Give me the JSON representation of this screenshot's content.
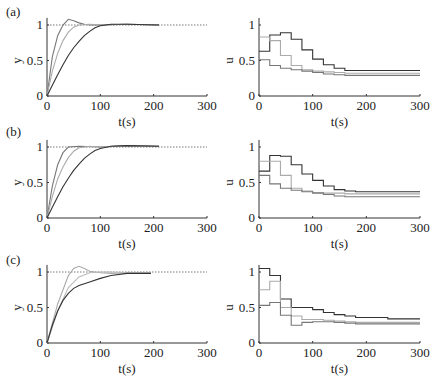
{
  "figure": {
    "panels": [
      {
        "label": "(a)"
      },
      {
        "label": "(b)"
      },
      {
        "label": "(c)"
      }
    ]
  },
  "chart_data": [
    {
      "panel": "(a)",
      "side": "left",
      "type": "line",
      "title": "",
      "xlabel": "t(s)",
      "ylabel": "y",
      "xlim": [
        0,
        300
      ],
      "ylim": [
        0,
        1.1
      ],
      "xticks": [
        "0",
        "100",
        "200",
        "300"
      ],
      "yticks": [
        "0",
        "0.5",
        "1"
      ],
      "reference": {
        "name": "setpoint",
        "y": 1,
        "style": "dotted"
      },
      "series": [
        {
          "name": "fast",
          "color": "#777777",
          "x": [
            0,
            10,
            20,
            30,
            40,
            50,
            60,
            70,
            80,
            100,
            150,
            210
          ],
          "y": [
            0,
            0.55,
            0.85,
            1.0,
            1.08,
            1.06,
            1.03,
            1.01,
            1.0,
            1.0,
            1.01,
            1.0
          ]
        },
        {
          "name": "medium",
          "color": "#aaaaaa",
          "x": [
            0,
            10,
            20,
            30,
            40,
            50,
            60,
            80,
            100,
            150,
            210
          ],
          "y": [
            0,
            0.35,
            0.6,
            0.78,
            0.9,
            0.97,
            1.0,
            1.01,
            1.0,
            1.01,
            1.0
          ]
        },
        {
          "name": "slow",
          "color": "#333333",
          "x": [
            0,
            10,
            20,
            30,
            40,
            50,
            60,
            70,
            80,
            90,
            100,
            120,
            150,
            210
          ],
          "y": [
            0,
            0.15,
            0.3,
            0.44,
            0.57,
            0.68,
            0.77,
            0.85,
            0.91,
            0.96,
            0.99,
            1.01,
            1.01,
            1.0
          ]
        }
      ]
    },
    {
      "panel": "(a)",
      "side": "right",
      "type": "line",
      "step": true,
      "title": "",
      "xlabel": "t(s)",
      "ylabel": "u",
      "xlim": [
        0,
        300
      ],
      "ylim": [
        0,
        1.1
      ],
      "xticks": [
        "0",
        "100",
        "200",
        "300"
      ],
      "yticks": [
        "0",
        "0.5",
        "1"
      ],
      "series": [
        {
          "name": "slow",
          "color": "#333333",
          "x": [
            0,
            20,
            40,
            60,
            80,
            100,
            120,
            140,
            160,
            300
          ],
          "y": [
            0.63,
            0.86,
            0.89,
            0.8,
            0.65,
            0.52,
            0.44,
            0.39,
            0.36,
            0.36
          ]
        },
        {
          "name": "medium",
          "color": "#aaaaaa",
          "x": [
            0,
            20,
            40,
            60,
            80,
            100,
            120,
            140,
            160,
            300
          ],
          "y": [
            0.83,
            0.78,
            0.57,
            0.43,
            0.37,
            0.35,
            0.34,
            0.33,
            0.32,
            0.32
          ]
        },
        {
          "name": "fast",
          "color": "#777777",
          "x": [
            0,
            20,
            40,
            60,
            80,
            100,
            120,
            140,
            160,
            300
          ],
          "y": [
            0.51,
            0.43,
            0.39,
            0.37,
            0.35,
            0.33,
            0.31,
            0.3,
            0.29,
            0.29
          ]
        }
      ]
    },
    {
      "panel": "(b)",
      "side": "left",
      "type": "line",
      "title": "",
      "xlabel": "t(s)",
      "ylabel": "y",
      "xlim": [
        0,
        300
      ],
      "ylim": [
        0,
        1.1
      ],
      "xticks": [
        "0",
        "100",
        "200",
        "300"
      ],
      "yticks": [
        "0",
        "0.5",
        "1"
      ],
      "reference": {
        "name": "setpoint",
        "y": 1,
        "style": "dotted"
      },
      "series": [
        {
          "name": "fast",
          "color": "#777777",
          "x": [
            0,
            10,
            20,
            30,
            40,
            60,
            100,
            150,
            210
          ],
          "y": [
            0,
            0.45,
            0.75,
            0.92,
            1.0,
            1.01,
            1.0,
            1.02,
            1.01
          ]
        },
        {
          "name": "medium",
          "color": "#aaaaaa",
          "x": [
            0,
            10,
            20,
            30,
            40,
            50,
            60,
            80,
            100,
            150,
            210
          ],
          "y": [
            0,
            0.3,
            0.55,
            0.72,
            0.85,
            0.94,
            0.99,
            1.01,
            1.0,
            1.02,
            1.01
          ]
        },
        {
          "name": "slow",
          "color": "#333333",
          "x": [
            0,
            10,
            20,
            30,
            40,
            50,
            60,
            70,
            80,
            90,
            100,
            120,
            150,
            210
          ],
          "y": [
            0,
            0.15,
            0.3,
            0.44,
            0.56,
            0.67,
            0.76,
            0.84,
            0.9,
            0.95,
            0.98,
            1.01,
            1.02,
            1.01
          ]
        }
      ]
    },
    {
      "panel": "(b)",
      "side": "right",
      "type": "line",
      "step": true,
      "title": "",
      "xlabel": "t(s)",
      "ylabel": "u",
      "xlim": [
        0,
        300
      ],
      "ylim": [
        0,
        1.1
      ],
      "xticks": [
        "0",
        "100",
        "200",
        "300"
      ],
      "yticks": [
        "0",
        "0.5",
        "1"
      ],
      "series": [
        {
          "name": "slow",
          "color": "#333333",
          "x": [
            0,
            20,
            40,
            60,
            80,
            100,
            120,
            140,
            160,
            180,
            300
          ],
          "y": [
            0.66,
            0.88,
            0.87,
            0.75,
            0.62,
            0.53,
            0.45,
            0.4,
            0.38,
            0.37,
            0.37
          ]
        },
        {
          "name": "medium",
          "color": "#aaaaaa",
          "x": [
            0,
            20,
            40,
            60,
            80,
            100,
            120,
            140,
            160,
            180,
            300
          ],
          "y": [
            0.8,
            0.8,
            0.6,
            0.42,
            0.38,
            0.36,
            0.35,
            0.35,
            0.34,
            0.34,
            0.34
          ]
        },
        {
          "name": "fast",
          "color": "#777777",
          "x": [
            0,
            20,
            40,
            60,
            80,
            100,
            120,
            140,
            160,
            180,
            300
          ],
          "y": [
            0.6,
            0.48,
            0.42,
            0.39,
            0.37,
            0.35,
            0.33,
            0.31,
            0.3,
            0.3,
            0.3
          ]
        }
      ]
    },
    {
      "panel": "(c)",
      "side": "left",
      "type": "line",
      "title": "",
      "xlabel": "t(s)",
      "ylabel": "y",
      "xlim": [
        0,
        300
      ],
      "ylim": [
        0,
        1.1
      ],
      "xticks": [
        "0",
        "100",
        "200",
        "300"
      ],
      "yticks": [
        "0",
        "0.5",
        "1"
      ],
      "reference": {
        "name": "setpoint",
        "y": 1,
        "style": "dotted"
      },
      "series": [
        {
          "name": "fast",
          "color": "#aaaaaa",
          "x": [
            0,
            20,
            40,
            50,
            60,
            70,
            80,
            100,
            120,
            150,
            195
          ],
          "y": [
            0,
            0.55,
            0.95,
            1.05,
            1.08,
            1.05,
            1.01,
            0.99,
            0.98,
            0.99,
            0.99
          ]
        },
        {
          "name": "medium",
          "color": "#bbbbbb",
          "x": [
            0,
            20,
            40,
            60,
            80,
            100,
            120,
            150,
            195
          ],
          "y": [
            0,
            0.45,
            0.78,
            0.93,
            0.99,
            1.0,
            1.0,
            0.99,
            0.99
          ]
        },
        {
          "name": "slow",
          "color": "#333333",
          "x": [
            0,
            10,
            20,
            30,
            40,
            50,
            60,
            80,
            100,
            120,
            150,
            195
          ],
          "y": [
            0,
            0.25,
            0.45,
            0.6,
            0.7,
            0.77,
            0.81,
            0.86,
            0.91,
            0.95,
            0.98,
            0.98
          ]
        }
      ]
    },
    {
      "panel": "(c)",
      "side": "right",
      "type": "line",
      "step": true,
      "title": "",
      "xlabel": "t(s)",
      "ylabel": "u",
      "xlim": [
        0,
        300
      ],
      "ylim": [
        0,
        1.1
      ],
      "xticks": [
        "0",
        "100",
        "200",
        "300"
      ],
      "yticks": [
        "0",
        "0.5",
        "1"
      ],
      "series": [
        {
          "name": "slow",
          "color": "#333333",
          "x": [
            0,
            20,
            40,
            60,
            80,
            100,
            120,
            140,
            160,
            180,
            200,
            240,
            300
          ],
          "y": [
            1.05,
            0.95,
            0.62,
            0.5,
            0.5,
            0.47,
            0.43,
            0.4,
            0.38,
            0.36,
            0.36,
            0.34,
            0.34
          ]
        },
        {
          "name": "medium",
          "color": "#aaaaaa",
          "x": [
            0,
            20,
            40,
            60,
            80,
            100,
            120,
            140,
            160,
            180,
            300
          ],
          "y": [
            0.75,
            0.87,
            0.5,
            0.38,
            0.33,
            0.33,
            0.32,
            0.31,
            0.3,
            0.29,
            0.29
          ]
        },
        {
          "name": "fast",
          "color": "#777777",
          "x": [
            0,
            20,
            40,
            60,
            80,
            100,
            120,
            140,
            160,
            180,
            300
          ],
          "y": [
            0.53,
            0.57,
            0.39,
            0.25,
            0.29,
            0.3,
            0.3,
            0.29,
            0.28,
            0.27,
            0.27
          ]
        }
      ]
    }
  ]
}
